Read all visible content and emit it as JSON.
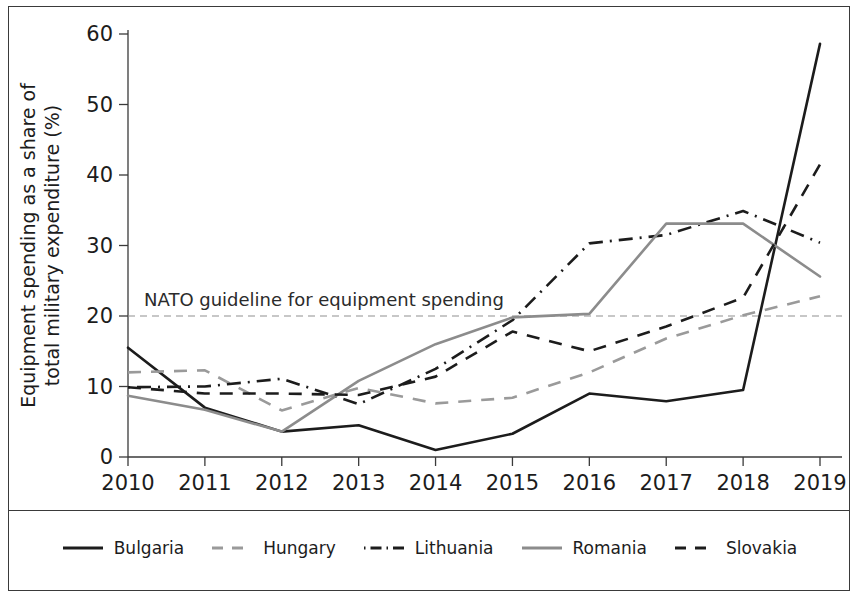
{
  "chart_data": {
    "type": "line",
    "title": "",
    "xlabel": "",
    "ylabel": "Equipment spending as a share of total military expenditure (%)",
    "x": [
      2010,
      2011,
      2012,
      2013,
      2014,
      2015,
      2016,
      2017,
      2018,
      2019
    ],
    "xticklabels": [
      "2010",
      "2011",
      "2012",
      "2013",
      "2014",
      "2015",
      "2016",
      "2017",
      "2018",
      "2019"
    ],
    "yticklabels": [
      "0",
      "10",
      "20",
      "30",
      "40",
      "50",
      "60"
    ],
    "yticks": [
      0,
      10,
      20,
      30,
      40,
      50,
      60
    ],
    "xlim": [
      2010,
      2019
    ],
    "ylim": [
      0,
      60
    ],
    "grid": false,
    "legend_position": "bottom",
    "series": [
      {
        "name": "Bulgaria",
        "color": "#1c1c1c",
        "dash": "solid",
        "width": 2.6,
        "values": [
          15.5,
          7.0,
          3.6,
          4.5,
          1.0,
          3.3,
          9.0,
          7.9,
          9.5,
          58.6
        ]
      },
      {
        "name": "Hungary",
        "color": "#9a9a9a",
        "dash": "dashed",
        "width": 2.6,
        "values": [
          12.0,
          12.3,
          6.6,
          9.8,
          7.6,
          8.4,
          12.0,
          16.8,
          20.1,
          22.8
        ]
      },
      {
        "name": "Lithuania",
        "color": "#1c1c1c",
        "dash": "dashdot",
        "width": 2.6,
        "values": [
          9.9,
          10.0,
          11.1,
          7.5,
          12.5,
          19.4,
          30.3,
          31.5,
          34.9,
          30.4
        ]
      },
      {
        "name": "Romania",
        "color": "#8c8c8c",
        "dash": "solid",
        "width": 2.6,
        "values": [
          8.7,
          6.7,
          3.6,
          10.8,
          16.0,
          19.8,
          20.3,
          33.1,
          33.1,
          25.6
        ]
      },
      {
        "name": "Slovakia",
        "color": "#1c1c1c",
        "dash": "dashed",
        "width": 2.6,
        "values": [
          9.9,
          9.0,
          9.0,
          8.8,
          11.4,
          17.8,
          15.0,
          18.5,
          22.6,
          41.5
        ]
      }
    ],
    "annotations": [
      {
        "name": "nato-guideline",
        "text": "NATO guideline for equipment spending",
        "y_value": 20,
        "line_style": "dashed",
        "line_color": "#8f8f8f"
      }
    ]
  },
  "legend": {
    "items": [
      {
        "label": "Bulgaria",
        "style": "solid-black"
      },
      {
        "label": "Hungary",
        "style": "dashed-gray"
      },
      {
        "label": "Lithuania",
        "style": "dashdot-black"
      },
      {
        "label": "Romania",
        "style": "solid-gray"
      },
      {
        "label": "Slovakia",
        "style": "dashed-black"
      }
    ]
  }
}
